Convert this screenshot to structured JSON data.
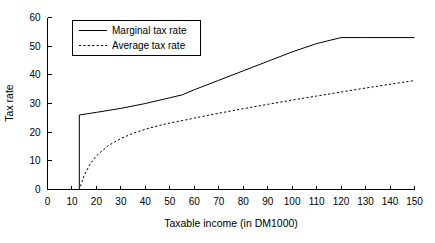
{
  "chart_data": {
    "type": "line",
    "title": "",
    "xlabel": "Taxable income (in DM1000)",
    "ylabel": "Tax rate",
    "xlim": [
      0,
      150
    ],
    "ylim": [
      0,
      60
    ],
    "xticks": [
      0,
      10,
      20,
      30,
      40,
      50,
      60,
      70,
      80,
      90,
      100,
      110,
      120,
      130,
      140,
      150
    ],
    "yticks": [
      0,
      10,
      20,
      30,
      40,
      50,
      60
    ],
    "xtick_labels": [
      "0",
      "10",
      "20",
      "30",
      "40",
      "50",
      "60",
      "70",
      "80",
      "90",
      "100",
      "110",
      "120",
      "130",
      "140",
      "150"
    ],
    "ytick_labels": [
      "0",
      "10",
      "20",
      "30",
      "40",
      "50",
      "60"
    ],
    "grid": false,
    "legend_position": "upper left",
    "series": [
      {
        "name": "Marginal tax rate",
        "style": "solid",
        "color": "#000000",
        "x": [
          0,
          13,
          13,
          20,
          30,
          40,
          50,
          55,
          60,
          70,
          80,
          90,
          100,
          110,
          120,
          130,
          140,
          150
        ],
        "values": [
          0,
          0,
          26.0,
          26.9,
          28.3,
          30.0,
          32.0,
          33.0,
          34.8,
          38.1,
          41.4,
          44.7,
          48.0,
          50.9,
          53.0,
          53.0,
          53.0,
          53.0
        ]
      },
      {
        "name": "Average tax rate",
        "style": "dashed",
        "color": "#000000",
        "x": [
          0,
          13,
          15,
          17.5,
          20,
          25,
          30,
          35,
          40,
          45,
          50,
          55,
          60,
          70,
          80,
          90,
          100,
          110,
          120,
          130,
          140,
          150
        ],
        "values": [
          0,
          0,
          5.0,
          9.0,
          11.8,
          15.4,
          17.8,
          19.6,
          21.0,
          22.2,
          23.2,
          24.0,
          24.9,
          26.6,
          28.2,
          29.7,
          31.2,
          32.6,
          34.0,
          35.4,
          36.7,
          38.0
        ]
      }
    ],
    "annotations": []
  },
  "legend": {
    "items": [
      {
        "label": "Marginal tax rate",
        "style": "solid"
      },
      {
        "label": "Average tax rate",
        "style": "dashed"
      }
    ]
  }
}
